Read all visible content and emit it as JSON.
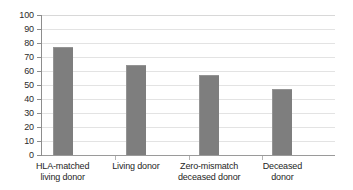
{
  "chart_data": {
    "type": "bar",
    "title": "",
    "xlabel": "",
    "ylabel": "",
    "ylim": [
      0,
      100
    ],
    "ytick_step": 10,
    "grid": true,
    "legend": "none",
    "bar_color": "#7e7e7e",
    "gridline_color": "#e3e3e3",
    "axis_color": "#8d8d8d",
    "categories": [
      "HLA-matched living donor",
      "Living donor",
      "Zero-mismatch deceased donor",
      "Deceased donor"
    ],
    "category_lines": [
      {
        "line1": "HLA-matched",
        "line2": "living donor"
      },
      {
        "line1": "Living donor",
        "line2": ""
      },
      {
        "line1": "Zero-mismatch",
        "line2": "deceased donor"
      },
      {
        "line1": "Deceased",
        "line2": "donor"
      }
    ],
    "values": [
      77,
      64,
      57,
      47
    ],
    "ytick_labels": [
      "100",
      "90",
      "80",
      "70",
      "60",
      "50",
      "40",
      "30",
      "20",
      "10",
      "0"
    ],
    "ytick_values": [
      100,
      90,
      80,
      70,
      60,
      50,
      40,
      30,
      20,
      10,
      0
    ]
  }
}
